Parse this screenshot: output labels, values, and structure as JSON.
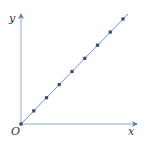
{
  "chart_data": {
    "type": "line",
    "title": "",
    "xlabel": "x",
    "ylabel": "y",
    "origin_label": "O",
    "grid": false,
    "x_ticks": [],
    "y_ticks": [],
    "series": [
      {
        "name": "direct proportion",
        "x": [
          0,
          1,
          2,
          3,
          4,
          5,
          6,
          7,
          8
        ],
        "y": [
          0,
          1,
          2,
          3,
          4,
          5,
          6,
          7,
          8
        ],
        "markers": true
      }
    ]
  },
  "colors": {
    "axis": "#8fa8d0",
    "line": "#7a8fb0",
    "marker": "#3a4d78",
    "text": "#333333"
  }
}
